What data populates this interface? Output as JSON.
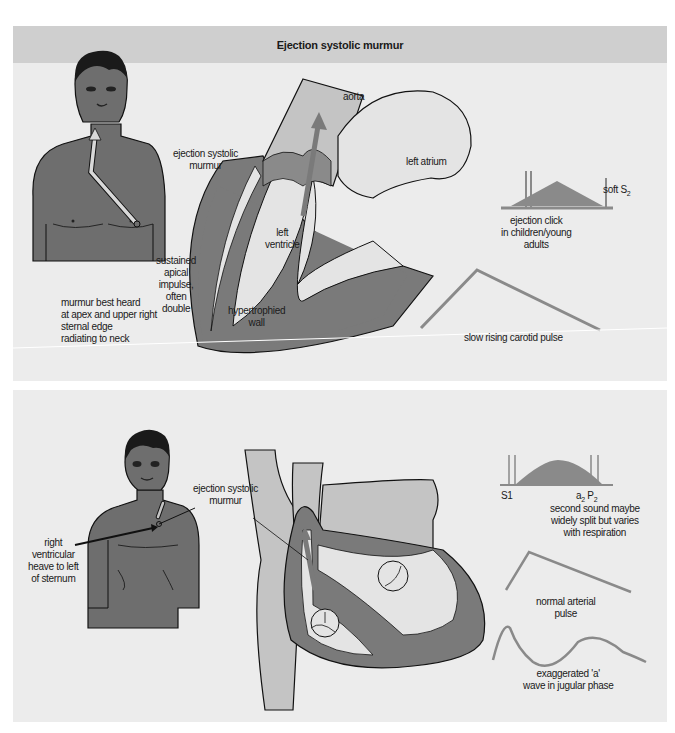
{
  "top_panel": {
    "title": "Ejection systolic murmur",
    "labels": {
      "murmur_location": "murmur best heard\nat apex and upper right\nsternal edge\nradiating to neck",
      "apical_impulse": "sustained\napical\nimpulse,\noften\ndouble",
      "ejection_murmur": "ejection systolic\nmurmur",
      "aorta": "aorta",
      "left_atrium": "left  atrium",
      "left_ventricle": "left\nventricle",
      "hypertrophied_wall": "hypertrophied\nwall",
      "ejection_click": "ejection click\nin children/young\nadults",
      "soft_s2": "soft S",
      "soft_s2_sub": "2",
      "carotid_pulse": "slow rising carotid pulse"
    }
  },
  "bottom_panel": {
    "labels": {
      "ejection_murmur": "ejection systolic\nmurmur",
      "rv_heave": "right\nventricular\nheave to left\nof sternum",
      "s1": "S1",
      "a2": "a",
      "a2_sub": "2",
      "p2": "P",
      "p2_sub": "2",
      "second_sound": "second sound maybe\nwidely split but varies\nwith respiration",
      "arterial_pulse": "normal arterial\npulse",
      "a_wave": "exaggerated 'a'\nwave in jugular phase"
    }
  },
  "colors": {
    "panel_bg": "#ececec",
    "header_bg": "#cfcfcf",
    "skin": "#6e6e6e",
    "muscle": "#7a7a7a",
    "vessel": "#c4c4c4",
    "chamber": "#e4e4e4",
    "waveform": "#8a8a8a"
  }
}
